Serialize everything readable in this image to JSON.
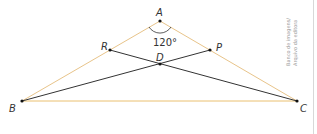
{
  "figure": {
    "points": {
      "A": {
        "label": "A",
        "x": 160,
        "y": 21
      },
      "B": {
        "label": "B",
        "x": 22,
        "y": 101
      },
      "C": {
        "label": "C",
        "x": 297,
        "y": 101
      },
      "R": {
        "label": "R",
        "x": 110,
        "y": 50
      },
      "P": {
        "label": "P",
        "x": 210,
        "y": 50
      },
      "D": {
        "label": "D",
        "x": 160,
        "y": 64
      }
    },
    "angle_label": "120°",
    "colors": {
      "triangle": "#e8b45a",
      "segments": "#333333",
      "points": "#111111"
    },
    "credit_line1": "Banco de imagens/",
    "credit_line2": "Arquivo da editora"
  }
}
